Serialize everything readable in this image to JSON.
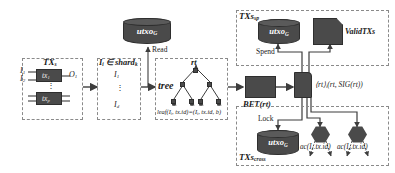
{
  "diagram": {
    "accent_dark": "#4a4a4a",
    "accent_light": "#5a5a5a",
    "dash_border": "#8a8a8a",
    "bg": "#ffffff"
  },
  "stage_tx": {
    "group_label": "TX",
    "group_label_sub": "s",
    "inputs": [
      "I",
      "I"
    ],
    "input_subs": [
      "1",
      "2"
    ],
    "op_top": "tx",
    "op_top_sub": "1",
    "op_bottom": "tx",
    "op_bottom_sub": "p",
    "output": "O",
    "output_sub": "1",
    "vdots": "⋮"
  },
  "stage_shard": {
    "header": "I",
    "header_sub": "i",
    "header_rel": " ∈ shard",
    "header_rel_sub": "k",
    "item_first": "I",
    "item_first_sub": "1",
    "vdots": "⋮",
    "item_last": "I",
    "item_last_sub": "d"
  },
  "stage_store": {
    "db_label": "utxo",
    "db_label_sub": "G",
    "edge_read": "Read"
  },
  "stage_tree": {
    "label": "tree",
    "root_label": "rt",
    "leaf_formula": "leaf(I",
    "leaf_formula_sub1": "i",
    "leaf_formula_mid": ", tx.id)=(I",
    "leaf_formula_sub2": "i",
    "leaf_formula_end": ", tx.id, b)"
  },
  "stage_bft": {
    "label": "BFT(rt)",
    "sig_open": "⟨rt⟩",
    "sig_sub": "i",
    "sig_body": "(rt, SIG(rt))"
  },
  "stage_spend": {
    "group_label": "TXs",
    "group_label_sub": "sp",
    "edge_label": "Spend",
    "db_label": "utxo",
    "db_label_sub": "G",
    "doc_label": "ValidTXs"
  },
  "stage_cross": {
    "group_label": "TXs",
    "group_label_sub": "cross",
    "edge_label": "Lock",
    "db_label": "utxo",
    "db_label_sub": "G",
    "node_left": "ac(I",
    "node_left_sub": "1",
    "node_left_end": ".tx.id)",
    "node_right": "ac(I",
    "node_right_sub": "d",
    "node_right_end": ".tx.id)"
  }
}
